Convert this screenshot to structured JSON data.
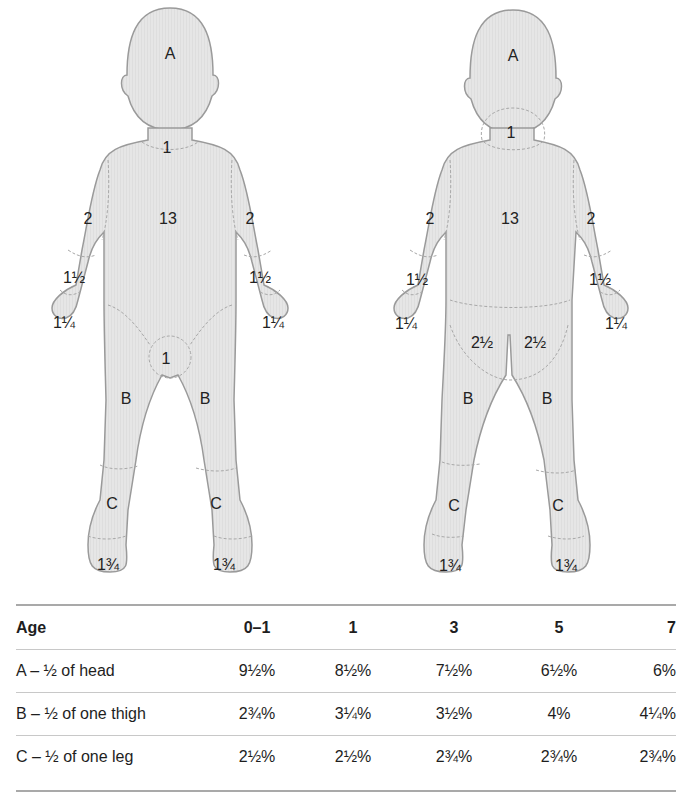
{
  "figure": {
    "front_view": {
      "labels": {
        "head": "A",
        "neck": "1",
        "trunk": "13",
        "upper_arm_left": "2",
        "upper_arm_right": "2",
        "forearm_left": "1½",
        "forearm_right": "1½",
        "hand_left": "1¼",
        "hand_right": "1¼",
        "genitals": "1",
        "thigh_left": "B",
        "thigh_right": "B",
        "leg_left": "C",
        "leg_right": "C",
        "foot_left": "1¾",
        "foot_right": "1¾"
      }
    },
    "back_view": {
      "labels": {
        "head": "A",
        "neck": "1",
        "trunk": "13",
        "upper_arm_left": "2",
        "upper_arm_right": "2",
        "forearm_left": "1½",
        "forearm_right": "1½",
        "hand_left": "1¼",
        "hand_right": "1¼",
        "buttock_left": "2½",
        "buttock_right": "2½",
        "thigh_left": "B",
        "thigh_right": "B",
        "leg_left": "C",
        "leg_right": "C",
        "foot_left": "1¾",
        "foot_right": "1¾"
      }
    },
    "colors": {
      "body_fill": "#e6e6e6",
      "outline": "#9a9a9a",
      "dashed": "#a8a8a8"
    }
  },
  "table": {
    "headers": [
      "Age",
      "0–1",
      "1",
      "3",
      "5",
      "7"
    ],
    "rows": [
      {
        "label": "A – ½ of head",
        "values": [
          "9½%",
          "8½%",
          "7½%",
          "6½%",
          "6%"
        ]
      },
      {
        "label": "B – ½ of one thigh",
        "values": [
          "2¾%",
          "3¼%",
          "3½%",
          "4%",
          "4¼%"
        ]
      },
      {
        "label": "C – ½ of one leg",
        "values": [
          "2½%",
          "2½%",
          "2¾%",
          "2¾%",
          "2¾%"
        ]
      }
    ]
  }
}
